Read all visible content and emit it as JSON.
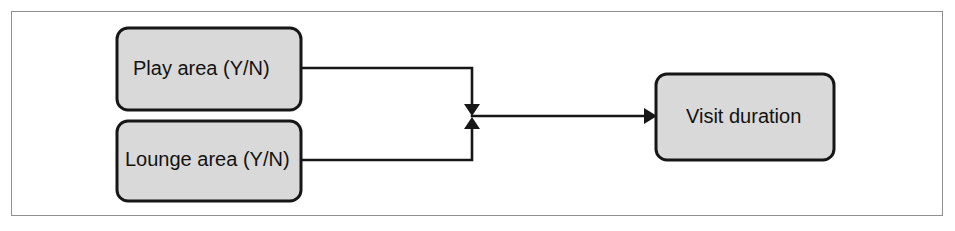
{
  "figure": {
    "type": "flow-diagram",
    "title": "",
    "frame": {
      "border_color": "#8f8f8f",
      "background": "#ffffff"
    },
    "style": {
      "node_fill": "#d9d9d9",
      "node_border": "#161616",
      "text_color": "#121212",
      "connector_color": "#161616"
    },
    "nodes": [
      {
        "id": "play-area",
        "label": "Play area (Y/N)",
        "role": "input",
        "x": 117,
        "y": 28,
        "width": 184,
        "height": 82,
        "radius": 11,
        "text_x": 133,
        "text_y": 70
      },
      {
        "id": "lounge-area",
        "label": "Lounge area (Y/N)",
        "role": "input",
        "x": 117,
        "y": 121,
        "width": 184,
        "height": 80,
        "radius": 11,
        "text_x": 125,
        "text_y": 161
      },
      {
        "id": "visit-duration",
        "label": "Visit duration",
        "role": "output",
        "x": 656,
        "y": 74,
        "width": 178,
        "height": 86,
        "radius": 11,
        "text_x": 686,
        "text_y": 118
      }
    ],
    "edges": [
      {
        "id": "play-to-junction",
        "from": "play-area",
        "to": "junction",
        "path": "M 301 68 L 472 68 L 472 106",
        "arrow": "down",
        "arrow_x": 472,
        "arrow_y": 115
      },
      {
        "id": "lounge-to-junction",
        "from": "lounge-area",
        "to": "junction",
        "path": "M 301 160 L 472 160 L 472 127",
        "arrow": "up",
        "arrow_x": 472,
        "arrow_y": 118
      },
      {
        "id": "junction-to-visit-duration",
        "from": "junction",
        "to": "visit-duration",
        "path": "M 472 116 L 646 116",
        "arrow": "right",
        "arrow_x": 655,
        "arrow_y": 116
      }
    ]
  }
}
